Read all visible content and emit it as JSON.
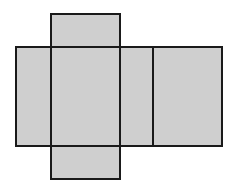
{
  "diagram": {
    "type": "box-net",
    "fill_color": "#cfcfcf",
    "stroke_color": "#1a1a1a",
    "faces": [
      {
        "name": "top-flap",
        "x": 51,
        "y": 14,
        "w": 69,
        "h": 33
      },
      {
        "name": "left-side",
        "x": 16,
        "y": 47,
        "w": 35,
        "h": 99
      },
      {
        "name": "front",
        "x": 51,
        "y": 47,
        "w": 69,
        "h": 99
      },
      {
        "name": "right-side",
        "x": 120,
        "y": 47,
        "w": 33,
        "h": 99
      },
      {
        "name": "back",
        "x": 153,
        "y": 47,
        "w": 69,
        "h": 99
      },
      {
        "name": "bottom-flap",
        "x": 51,
        "y": 146,
        "w": 69,
        "h": 33
      }
    ]
  }
}
